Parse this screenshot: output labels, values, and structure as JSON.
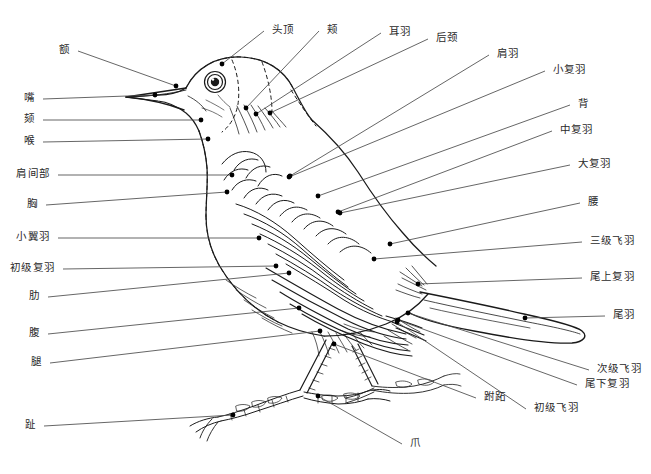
{
  "diagram": {
    "width": 651,
    "height": 474,
    "background_color": "#ffffff",
    "ink_color": "#1a1a1a",
    "leader_line_color": "#4a4a4a",
    "label_color": "#2a2a2a",
    "marker_color": "#000000"
  },
  "labels": [
    {
      "id": "forehead",
      "text": "额",
      "tx": 70,
      "ty": 50,
      "anchor": "end",
      "px": 176,
      "py": 86
    },
    {
      "id": "crown",
      "text": "头顶",
      "tx": 272,
      "ty": 30,
      "anchor": "start",
      "px": 222,
      "py": 64
    },
    {
      "id": "cheek",
      "text": "颊",
      "tx": 327,
      "ty": 30,
      "anchor": "start",
      "px": 246,
      "py": 108
    },
    {
      "id": "ear-coverts",
      "text": "耳羽",
      "tx": 389,
      "ty": 32,
      "anchor": "start",
      "px": 256,
      "py": 114
    },
    {
      "id": "nape",
      "text": "后颈",
      "tx": 436,
      "ty": 38,
      "anchor": "start",
      "px": 270,
      "py": 113
    },
    {
      "id": "scapulars",
      "text": "肩羽",
      "tx": 497,
      "ty": 54,
      "anchor": "start",
      "px": 290,
      "py": 176
    },
    {
      "id": "lesser-coverts",
      "text": "小复羽",
      "tx": 553,
      "ty": 70,
      "anchor": "start",
      "px": 289,
      "py": 177
    },
    {
      "id": "back",
      "text": "背",
      "tx": 578,
      "ty": 104,
      "anchor": "start",
      "px": 318,
      "py": 196
    },
    {
      "id": "median-coverts",
      "text": "中复羽",
      "tx": 560,
      "ty": 130,
      "anchor": "start",
      "px": 338,
      "py": 212
    },
    {
      "id": "greater-coverts",
      "text": "大复羽",
      "tx": 578,
      "ty": 164,
      "anchor": "start",
      "px": 340,
      "py": 213
    },
    {
      "id": "rump",
      "text": "腰",
      "tx": 588,
      "ty": 202,
      "anchor": "start",
      "px": 390,
      "py": 244
    },
    {
      "id": "tertials",
      "text": "三级飞羽",
      "tx": 590,
      "ty": 241,
      "anchor": "start",
      "px": 374,
      "py": 259
    },
    {
      "id": "upper-tail-coverts",
      "text": "尾上复羽",
      "tx": 590,
      "ty": 277,
      "anchor": "start",
      "px": 418,
      "py": 284
    },
    {
      "id": "tail-feathers",
      "text": "尾羽",
      "tx": 613,
      "ty": 315,
      "anchor": "start",
      "px": 525,
      "py": 318
    },
    {
      "id": "secondaries",
      "text": "次级飞羽",
      "tx": 597,
      "ty": 369,
      "anchor": "start",
      "px": 408,
      "py": 313
    },
    {
      "id": "under-tail-coverts",
      "text": "尾下复羽",
      "tx": 585,
      "ty": 384,
      "anchor": "start",
      "px": 398,
      "py": 320
    },
    {
      "id": "primaries",
      "text": "初级飞羽",
      "tx": 534,
      "ty": 408,
      "anchor": "start",
      "px": 397,
      "py": 322
    },
    {
      "id": "tarsus",
      "text": "跗跖",
      "tx": 484,
      "ty": 397,
      "anchor": "start",
      "px": 334,
      "py": 344
    },
    {
      "id": "claw",
      "text": "爪",
      "tx": 410,
      "ty": 443,
      "anchor": "start",
      "px": 318,
      "py": 396
    },
    {
      "id": "toe",
      "text": "趾",
      "tx": 36,
      "ty": 425,
      "anchor": "end",
      "px": 233,
      "py": 415
    },
    {
      "id": "beak",
      "text": "嘴",
      "tx": 35,
      "ty": 98,
      "anchor": "end",
      "px": 155,
      "py": 95
    },
    {
      "id": "chin",
      "text": "颏",
      "tx": 35,
      "ty": 119,
      "anchor": "end",
      "px": 201,
      "py": 120
    },
    {
      "id": "throat",
      "text": "喉",
      "tx": 35,
      "ty": 141,
      "anchor": "end",
      "px": 208,
      "py": 139
    },
    {
      "id": "interscapular",
      "text": "肩间部",
      "tx": 50,
      "ty": 174,
      "anchor": "end",
      "px": 232,
      "py": 175
    },
    {
      "id": "breast",
      "text": "胸",
      "tx": 38,
      "ty": 204,
      "anchor": "end",
      "px": 227,
      "py": 192
    },
    {
      "id": "alula",
      "text": "小翼羽",
      "tx": 50,
      "ty": 237,
      "anchor": "end",
      "px": 259,
      "py": 238
    },
    {
      "id": "primary-coverts",
      "text": "初级复羽",
      "tx": 55,
      "ty": 268,
      "anchor": "end",
      "px": 276,
      "py": 266
    },
    {
      "id": "flank",
      "text": "肋",
      "tx": 40,
      "ty": 296,
      "anchor": "end",
      "px": 289,
      "py": 273
    },
    {
      "id": "belly",
      "text": "腹",
      "tx": 40,
      "ty": 333,
      "anchor": "end",
      "px": 299,
      "py": 308
    },
    {
      "id": "thigh",
      "text": "腿",
      "tx": 42,
      "ty": 362,
      "anchor": "end",
      "px": 320,
      "py": 331
    }
  ]
}
